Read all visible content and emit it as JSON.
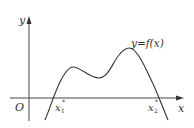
{
  "diagram": {
    "type": "function-graph",
    "axes": {
      "x_label": "x",
      "y_label": "y",
      "origin_label": "O"
    },
    "curve_label": "y=f(x)",
    "roots": [
      {
        "label_base": "x",
        "label_sub": "1",
        "label_sup": "*"
      },
      {
        "label_base": "x",
        "label_sub": "2",
        "label_sup": "*"
      }
    ],
    "colors": {
      "stroke": "#333333",
      "background": "#ffffff"
    }
  }
}
